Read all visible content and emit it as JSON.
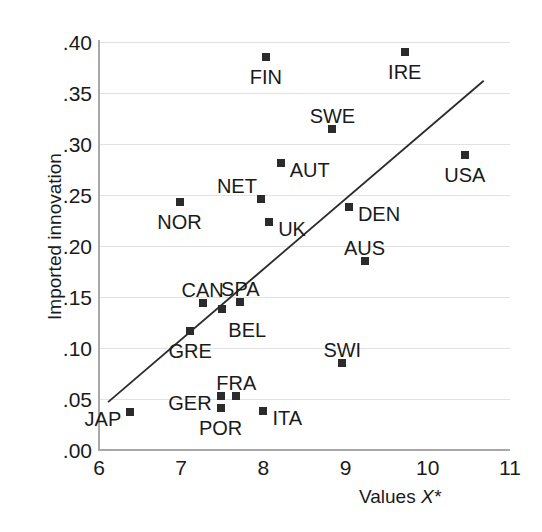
{
  "chart_data": {
    "type": "scatter",
    "title": "",
    "xlabel": "Values X*",
    "ylabel": "Imported innovation",
    "xlim": [
      6,
      11
    ],
    "ylim": [
      0.0,
      0.4
    ],
    "xticks": [
      "6",
      "7",
      "8",
      "9",
      "10",
      "11"
    ],
    "xtick_values": [
      6,
      7,
      8,
      9,
      10,
      11
    ],
    "yticks": [
      ".00",
      ".05",
      ".10",
      ".15",
      ".20",
      ".25",
      ".30",
      ".35",
      ".40"
    ],
    "ytick_values": [
      0.0,
      0.05,
      0.1,
      0.15,
      0.2,
      0.25,
      0.3,
      0.35,
      0.4
    ],
    "grid": "horizontal",
    "legend": "none",
    "marker": "filled-square",
    "marker_color": "#2b2b2b",
    "trendline": {
      "visible": true,
      "color": "#2b2b2b",
      "x_start": 6.11,
      "y_start": 0.047,
      "x_end": 10.68,
      "y_end": 0.362
    },
    "points": [
      {
        "label": "JAP",
        "x": 6.38,
        "y": 0.037,
        "label_pos": "left"
      },
      {
        "label": "NOR",
        "x": 6.98,
        "y": 0.243,
        "label_pos": "below"
      },
      {
        "label": "GRE",
        "x": 7.11,
        "y": 0.117,
        "label_pos": "below"
      },
      {
        "label": "CAN",
        "x": 7.26,
        "y": 0.144,
        "label_pos": "above"
      },
      {
        "label": "GER",
        "x": 7.48,
        "y": 0.053,
        "label_pos": "left"
      },
      {
        "label": "POR",
        "x": 7.48,
        "y": 0.041,
        "label_pos": "below"
      },
      {
        "label": "BEL",
        "x": 7.5,
        "y": 0.138,
        "label_pos": "below-right"
      },
      {
        "label": "FRA",
        "x": 7.67,
        "y": 0.053,
        "label_pos": "above"
      },
      {
        "label": "SPA",
        "x": 7.72,
        "y": 0.145,
        "label_pos": "above"
      },
      {
        "label": "NET",
        "x": 7.97,
        "y": 0.246,
        "label_pos": "above-left"
      },
      {
        "label": "ITA",
        "x": 8.0,
        "y": 0.038,
        "label_pos": "right"
      },
      {
        "label": "FIN",
        "x": 8.03,
        "y": 0.385,
        "label_pos": "below"
      },
      {
        "label": "UK",
        "x": 8.07,
        "y": 0.224,
        "label_pos": "right"
      },
      {
        "label": "AUT",
        "x": 8.21,
        "y": 0.281,
        "label_pos": "right"
      },
      {
        "label": "SWE",
        "x": 8.84,
        "y": 0.315,
        "label_pos": "above"
      },
      {
        "label": "SWI",
        "x": 8.96,
        "y": 0.085,
        "label_pos": "above"
      },
      {
        "label": "DEN",
        "x": 9.04,
        "y": 0.238,
        "label_pos": "right"
      },
      {
        "label": "AUS",
        "x": 9.23,
        "y": 0.185,
        "label_pos": "above"
      },
      {
        "label": "IRE",
        "x": 9.72,
        "y": 0.39,
        "label_pos": "below"
      },
      {
        "label": "USA",
        "x": 10.45,
        "y": 0.289,
        "label_pos": "below"
      }
    ]
  }
}
